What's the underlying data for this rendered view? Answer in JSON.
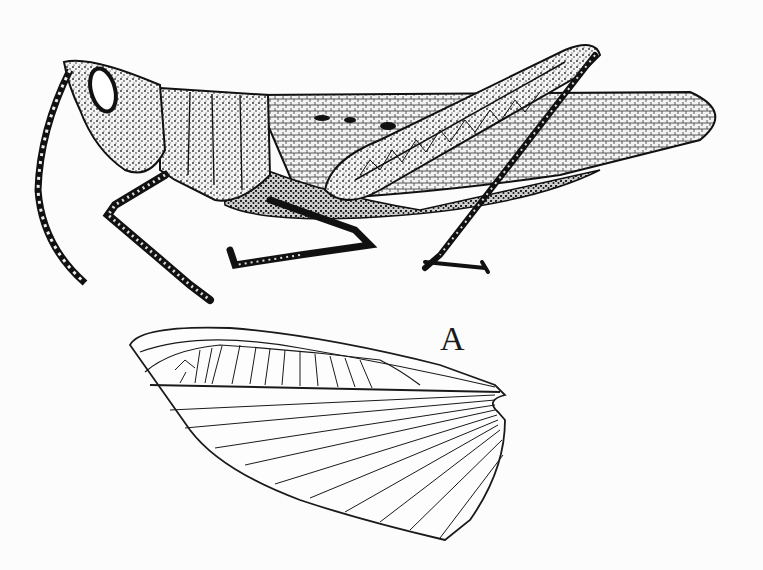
{
  "figure": {
    "labels": {
      "wing": "A"
    },
    "colors": {
      "ink": "#1a1a1a",
      "paper": "#fcfcfc",
      "stipple": "#333333"
    }
  }
}
